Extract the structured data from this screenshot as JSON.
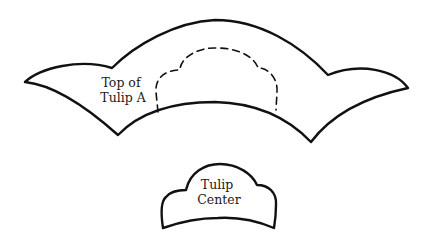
{
  "diagram": {
    "shapes": [
      {
        "id": "top-of-tulip-a",
        "label_lines": [
          "Top of",
          "Tulip A"
        ],
        "style": "solid outline",
        "inner_guide": "dashed scalloped outline (tulip center placement)"
      },
      {
        "id": "tulip-center",
        "label_lines": [
          "Tulip",
          "Center"
        ],
        "style": "solid outline"
      }
    ],
    "colors": {
      "stroke": "#111111",
      "background": "#ffffff"
    }
  }
}
